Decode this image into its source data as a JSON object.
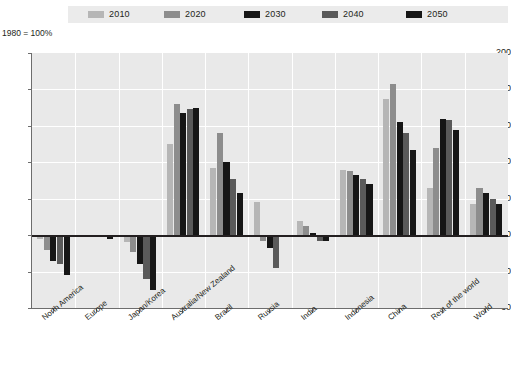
{
  "chart_data": {
    "type": "bar",
    "title": "",
    "subtitle": "",
    "axis_note": "1980 = 100%",
    "xlabel": "",
    "ylabel": "",
    "ylim": [
      60,
      200
    ],
    "yticks": [
      60,
      80,
      100,
      120,
      140,
      160,
      180,
      200
    ],
    "ytick_labels": [
      "60",
      "80",
      "100",
      "120",
      "140",
      "160",
      "180",
      "200"
    ],
    "baseline": 100,
    "grid": true,
    "legend_position": "top",
    "categories": [
      "North America",
      "Europe",
      "Japan/Korea",
      "Australia/New Zealand",
      "Brazil",
      "Russia",
      "India",
      "Indonesia",
      "China",
      "Rest of the world",
      "World"
    ],
    "series": [
      {
        "name": "2010",
        "color": "#b6b6b6",
        "values": [
          98,
          100,
          96,
          150,
          137,
          118,
          108,
          136,
          175,
          126,
          117
        ]
      },
      {
        "name": "2020",
        "color": "#8d8d8d",
        "values": [
          92,
          99,
          91,
          172,
          156,
          97,
          105,
          135,
          183,
          148,
          126
        ]
      },
      {
        "name": "2030",
        "color": "#161616",
        "values": [
          86,
          99,
          84,
          167,
          140,
          93,
          101,
          133,
          162,
          164,
          123
        ]
      },
      {
        "name": "2040",
        "color": "#5a5a5a",
        "values": [
          84,
          99,
          76,
          169,
          131,
          82,
          97,
          131,
          156,
          163,
          120
        ]
      },
      {
        "name": "2050",
        "color": "#161616",
        "values": [
          78,
          98,
          70,
          170,
          123,
          100,
          97,
          128,
          147,
          158,
          117
        ]
      }
    ]
  },
  "legend": {
    "items": [
      {
        "label": "2010",
        "color": "#b6b6b6"
      },
      {
        "label": "2020",
        "color": "#8d8d8d"
      },
      {
        "label": "2030",
        "color": "#161616"
      },
      {
        "label": "2040",
        "color": "#5a5a5a"
      },
      {
        "label": "2050",
        "color": "#161616"
      }
    ]
  },
  "colors": {
    "plot_background": "#e9e9e9",
    "legend_background": "#ebebeb",
    "gridline": "#ffffff",
    "axis": "#6d6d6d",
    "zero_line": "#231f20",
    "text": "#231f20"
  }
}
